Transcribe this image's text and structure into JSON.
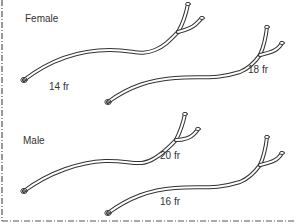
{
  "diagram": {
    "sections": [
      {
        "label": "Female",
        "catheters": [
          {
            "size": "14 fr"
          },
          {
            "size": "18 fr"
          }
        ]
      },
      {
        "label": "Male",
        "catheters": [
          {
            "size": "20 fr"
          },
          {
            "size": "16 fr"
          }
        ]
      }
    ],
    "colors": {
      "line": "#333333",
      "border": "#555555",
      "background": "#ffffff"
    }
  }
}
